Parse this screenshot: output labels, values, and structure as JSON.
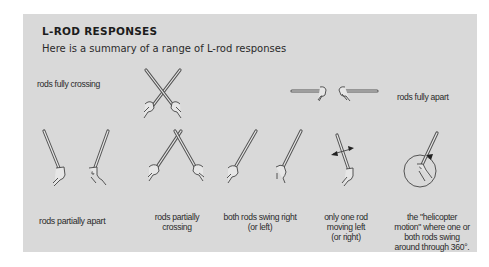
{
  "figure": {
    "title": "L-ROD RESPONSES",
    "subtitle": "Here is a summary of a range of L-rod responses",
    "background_color": "#d9d9d9",
    "responses": [
      {
        "id": "fully-crossing",
        "label": "rods fully crossing",
        "icon": "crossed-rods-icon"
      },
      {
        "id": "fully-apart",
        "label": "rods fully apart",
        "icon": "rods-apart-horizontal-icon"
      },
      {
        "id": "partially-apart",
        "label": "rods partially apart",
        "icon": "rods-partially-apart-icon"
      },
      {
        "id": "partially-crossing",
        "label_line1": "rods partially",
        "label_line2": "crossing",
        "icon": "rods-partially-crossing-icon"
      },
      {
        "id": "swing-right",
        "label_line1": "both rods swing right",
        "label_line2": "(or left)",
        "icon": "rods-swing-right-icon"
      },
      {
        "id": "one-rod-left",
        "label_line1": "only one rod",
        "label_line2": "moving left",
        "label_line3": "(or right)",
        "icon": "single-rod-arrows-icon"
      },
      {
        "id": "helicopter",
        "label_line1": "the \"helicopter",
        "label_line2": "motion\" where one or",
        "label_line3": "both rods swing",
        "label_line4": "around through 360°.",
        "icon": "helicopter-rotation-icon"
      }
    ]
  }
}
